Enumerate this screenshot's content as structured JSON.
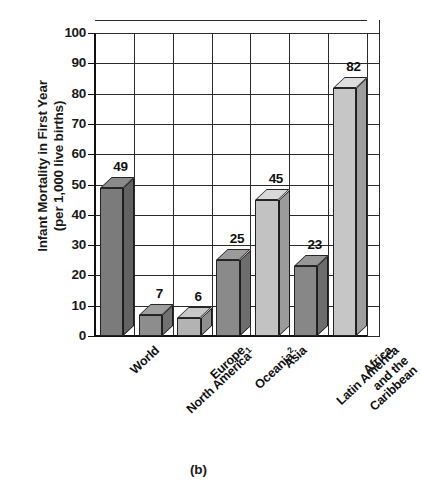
{
  "figure": {
    "caption": "(b)"
  },
  "chart_data": {
    "type": "bar",
    "title": "",
    "ylabel_line1": "Infant Mortality in First Year",
    "ylabel_line2": "(per 1,000 live births)",
    "xlabel": "",
    "ylim": [
      0,
      100
    ],
    "ytick_step": 10,
    "grid": true,
    "legend": "none",
    "style": "3d-bars",
    "categories": [
      "World",
      "North America",
      "Europe",
      "Oceania",
      "Asia",
      "Latin America and the Caribbean",
      "Africa"
    ],
    "category_footnotes": [
      "",
      "1",
      "",
      "2",
      "",
      "",
      ""
    ],
    "category_label_lines": [
      [
        "World"
      ],
      [
        "North America"
      ],
      [
        "Europe"
      ],
      [
        "Oceania"
      ],
      [
        "Asia"
      ],
      [
        "Latin America",
        "and the",
        "Caribbean"
      ],
      [
        "Africa"
      ]
    ],
    "values": [
      49,
      7,
      6,
      25,
      45,
      23,
      82
    ],
    "value_labels": [
      "49",
      "7",
      "6",
      "25",
      "45",
      "23",
      "82"
    ],
    "bar_shades": [
      "#7b7b7b",
      "#8d8d8d",
      "#b3b3b3",
      "#8a8a8a",
      "#c2c2c2",
      "#878787",
      "#c6c6c6"
    ],
    "ytick_labels": [
      "100",
      "90",
      "80",
      "70",
      "60",
      "50",
      "40",
      "30",
      "20",
      "10",
      "0"
    ],
    "ytick_values": [
      100,
      90,
      80,
      70,
      60,
      50,
      40,
      30,
      20,
      10,
      0
    ]
  }
}
